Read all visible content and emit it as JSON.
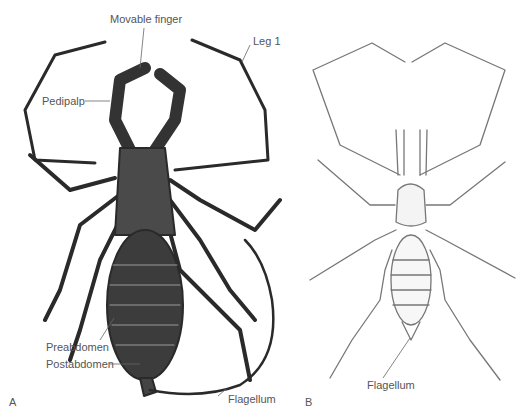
{
  "figure": {
    "panels": [
      {
        "id": "A",
        "label": "A",
        "subject": "whip scorpion (dorsal view, shaded)"
      },
      {
        "id": "B",
        "label": "B",
        "subject": "schizomid (dorsal view, line drawing)"
      }
    ],
    "labels_A": {
      "movable_finger": "Movable finger",
      "leg1": "Leg 1",
      "pedipalp": "Pedipalp",
      "preabdomen": "Preabdomen",
      "postabdomen": "Postabdomen",
      "flagellum": "Flagellum"
    },
    "labels_B": {
      "flagellum": "Flagellum"
    },
    "colors": {
      "ink_dark": "#2a2a2a",
      "ink_light": "#777777",
      "label_text": "#555555",
      "background": "#ffffff"
    }
  }
}
